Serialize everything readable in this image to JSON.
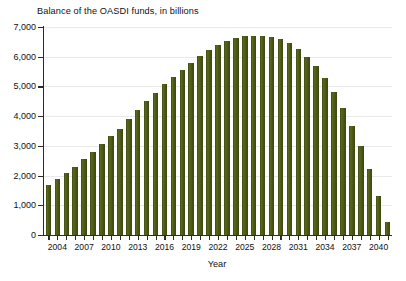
{
  "chart_data": {
    "type": "bar",
    "title": "Balance of the OASDI funds, in billions",
    "xlabel": "Year",
    "ylabel": "",
    "ylim": [
      0,
      7000
    ],
    "xlim": [
      2002.5,
      2041.5
    ],
    "grid": true,
    "legend": "none",
    "bar_color": "#4d5a18",
    "y_ticks": [
      0,
      1000,
      2000,
      3000,
      4000,
      5000,
      6000,
      7000
    ],
    "y_tick_labels": [
      "0",
      "1,000",
      "2,000",
      "3,000",
      "4,000",
      "5,000",
      "6,000",
      "7,000"
    ],
    "x_tick_labels": [
      "2004",
      "2007",
      "2010",
      "2013",
      "2016",
      "2019",
      "2022",
      "2025",
      "2028",
      "2031",
      "2034",
      "2037",
      "2040"
    ],
    "x_tick_years": [
      2004,
      2007,
      2010,
      2013,
      2016,
      2019,
      2022,
      2025,
      2028,
      2031,
      2034,
      2037,
      2040
    ],
    "categories": [
      2003,
      2004,
      2005,
      2006,
      2007,
      2008,
      2009,
      2010,
      2011,
      2012,
      2013,
      2014,
      2015,
      2016,
      2017,
      2018,
      2019,
      2020,
      2021,
      2022,
      2023,
      2024,
      2025,
      2026,
      2027,
      2028,
      2029,
      2030,
      2031,
      2032,
      2033,
      2034,
      2035,
      2036,
      2037,
      2038,
      2039,
      2040,
      2041
    ],
    "values": [
      1690,
      1900,
      2080,
      2280,
      2550,
      2800,
      3050,
      3340,
      3580,
      3920,
      4210,
      4510,
      4770,
      5080,
      5320,
      5570,
      5800,
      6010,
      6210,
      6400,
      6540,
      6640,
      6690,
      6710,
      6710,
      6680,
      6600,
      6450,
      6250,
      6000,
      5680,
      5280,
      4800,
      4270,
      3660,
      3000,
      2220,
      1320,
      450
    ]
  }
}
